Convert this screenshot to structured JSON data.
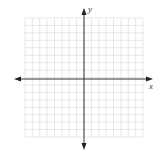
{
  "diagram": {
    "type": "coordinate-plane",
    "grid": {
      "columns": 16,
      "rows": 16,
      "left": 25,
      "top": 18,
      "right": 143,
      "bottom": 137,
      "color": "#d8d8d8"
    },
    "axes": {
      "origin_x": 84,
      "origin_y": 79,
      "color": "#333333",
      "x_label": "x",
      "y_label": "y"
    }
  }
}
